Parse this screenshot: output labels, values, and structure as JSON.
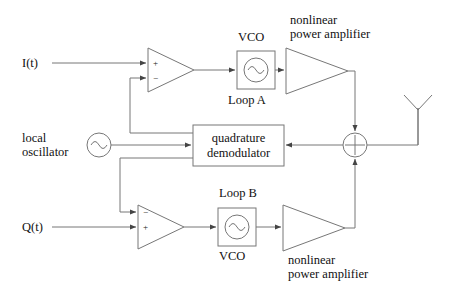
{
  "figure": {
    "background_color": "#ffffff",
    "line_color": "#666666",
    "text_color": "#111111"
  },
  "labels": {
    "input_i": "I(t)",
    "input_q": "Q(t)",
    "local_oscillator_line1": "local",
    "local_oscillator_line2": "oscillator",
    "vco_top": "VCO",
    "vco_bottom": "VCO",
    "loop_a": "Loop A",
    "loop_b": "Loop B",
    "amp_top_line1": "nonlinear",
    "amp_top_line2": "power amplifier",
    "amp_bottom_line1": "nonlinear",
    "amp_bottom_line2": "power amplifier",
    "demodulator_line1": "quadrature",
    "demodulator_line2": "demodulator"
  },
  "signs": {
    "opamp_top_plus": "+",
    "opamp_top_minus": "−",
    "opamp_bottom_minus": "−",
    "opamp_bottom_plus": "+",
    "summer_plus": "+"
  },
  "blocks": [
    {
      "name": "vco-top",
      "kind": "sine-source-box",
      "x": 237,
      "y": 51,
      "w": 38,
      "h": 38
    },
    {
      "name": "vco-bottom",
      "kind": "sine-source-box",
      "x": 218,
      "y": 208,
      "w": 38,
      "h": 38
    },
    {
      "name": "quadrature-demodulator",
      "kind": "rect",
      "x": 193,
      "y": 125,
      "w": 91,
      "h": 41
    },
    {
      "name": "local-oscillator",
      "kind": "sine-source-circle",
      "cx": 99,
      "cy": 145,
      "r": 12
    },
    {
      "name": "summing-junction",
      "kind": "plus-circle",
      "cx": 355,
      "cy": 145,
      "r": 12
    },
    {
      "name": "opamp-top",
      "kind": "triangle",
      "x": 148,
      "y": 48,
      "w": 46,
      "h": 44
    },
    {
      "name": "opamp-bottom",
      "kind": "triangle",
      "x": 138,
      "y": 205,
      "w": 46,
      "h": 44
    },
    {
      "name": "amplifier-top",
      "kind": "triangle",
      "x": 286,
      "y": 48,
      "w": 62,
      "h": 46
    },
    {
      "name": "amplifier-bottom",
      "kind": "triangle",
      "x": 283,
      "y": 205,
      "w": 62,
      "h": 46
    },
    {
      "name": "antenna",
      "kind": "antenna",
      "x": 418,
      "y": 108
    }
  ]
}
